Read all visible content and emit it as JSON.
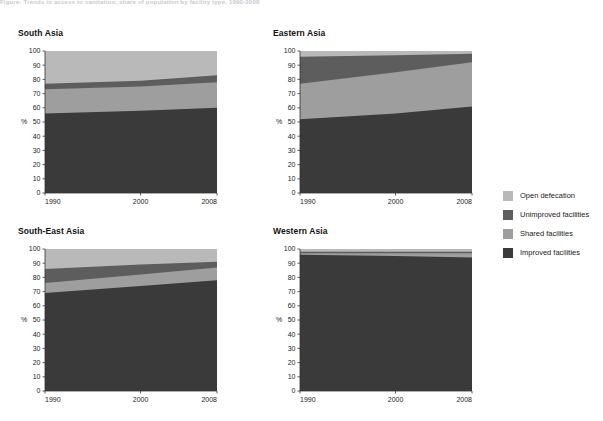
{
  "header": {
    "truncated_caption": "Figure: Trends in access to sanitation, share of population by facility type, 1990-2008"
  },
  "axis": {
    "ylabel": "%",
    "yticks": [
      0,
      10,
      20,
      30,
      40,
      50,
      60,
      70,
      80,
      90,
      100
    ],
    "xticks": [
      "1990",
      "2000",
      "2008"
    ]
  },
  "legend": {
    "items": [
      {
        "label": "Open defecation",
        "color": "#b9b9b9"
      },
      {
        "label": "Unimproved facilities",
        "color": "#5d5d5d"
      },
      {
        "label": "Shared facilities",
        "color": "#9e9e9e"
      },
      {
        "label": "Improved facilities",
        "color": "#3a3a3a"
      }
    ]
  },
  "colors": {
    "improved": "#3a3a3a",
    "shared": "#9e9e9e",
    "unimproved": "#5d5d5d",
    "open_defecation": "#b9b9b9",
    "axis": "#333333"
  },
  "chart_data": [
    {
      "type": "area",
      "title": "South Asia",
      "xlabel": "",
      "ylabel": "%",
      "x": [
        1990,
        2000,
        2008
      ],
      "xlim": [
        1990,
        2008
      ],
      "ylim": [
        0,
        100
      ],
      "grid": false,
      "stacked": true,
      "legend_position": "right",
      "series": [
        {
          "name": "Improved facilities",
          "values": [
            56,
            58,
            60
          ]
        },
        {
          "name": "Shared facilities",
          "values": [
            17,
            17,
            18
          ]
        },
        {
          "name": "Unimproved facilities",
          "values": [
            4,
            4,
            5
          ]
        },
        {
          "name": "Open defecation",
          "values": [
            23,
            21,
            17
          ]
        }
      ],
      "cumulative": [
        {
          "name": "Improved facilities",
          "values": [
            56,
            58,
            60
          ]
        },
        {
          "name": "Shared facilities",
          "values": [
            73,
            75,
            78
          ]
        },
        {
          "name": "Unimproved facilities",
          "values": [
            77,
            79,
            83
          ]
        },
        {
          "name": "Open defecation",
          "values": [
            100,
            100,
            100
          ]
        }
      ]
    },
    {
      "type": "area",
      "title": "Eastern Asia",
      "xlabel": "",
      "ylabel": "%",
      "x": [
        1990,
        2000,
        2008
      ],
      "xlim": [
        1990,
        2008
      ],
      "ylim": [
        0,
        100
      ],
      "grid": false,
      "stacked": true,
      "legend_position": "right",
      "series": [
        {
          "name": "Improved facilities",
          "values": [
            52,
            56,
            61
          ]
        },
        {
          "name": "Shared facilities",
          "values": [
            25,
            29,
            31
          ]
        },
        {
          "name": "Unimproved facilities",
          "values": [
            19,
            12,
            6
          ]
        },
        {
          "name": "Open defecation",
          "values": [
            4,
            3,
            2
          ]
        }
      ],
      "cumulative": [
        {
          "name": "Improved facilities",
          "values": [
            52,
            56,
            61
          ]
        },
        {
          "name": "Shared facilities",
          "values": [
            77,
            85,
            92
          ]
        },
        {
          "name": "Unimproved facilities",
          "values": [
            96,
            97,
            98
          ]
        },
        {
          "name": "Open defecation",
          "values": [
            100,
            100,
            100
          ]
        }
      ]
    },
    {
      "type": "area",
      "title": "South-East Asia",
      "xlabel": "",
      "ylabel": "%",
      "x": [
        1990,
        2000,
        2008
      ],
      "xlim": [
        1990,
        2008
      ],
      "ylim": [
        0,
        100
      ],
      "grid": false,
      "stacked": true,
      "legend_position": "right",
      "series": [
        {
          "name": "Improved facilities",
          "values": [
            69,
            74,
            78
          ]
        },
        {
          "name": "Shared facilities",
          "values": [
            7,
            8,
            9
          ]
        },
        {
          "name": "Unimproved facilities",
          "values": [
            10,
            7,
            4
          ]
        },
        {
          "name": "Open defecation",
          "values": [
            14,
            11,
            9
          ]
        }
      ],
      "cumulative": [
        {
          "name": "Improved facilities",
          "values": [
            69,
            74,
            78
          ]
        },
        {
          "name": "Shared facilities",
          "values": [
            76,
            82,
            87
          ]
        },
        {
          "name": "Unimproved facilities",
          "values": [
            86,
            89,
            91
          ]
        },
        {
          "name": "Open defecation",
          "values": [
            100,
            100,
            100
          ]
        }
      ]
    },
    {
      "type": "area",
      "title": "Western Asia",
      "xlabel": "",
      "ylabel": "%",
      "x": [
        1990,
        2000,
        2008
      ],
      "xlim": [
        1990,
        2008
      ],
      "ylim": [
        0,
        100
      ],
      "grid": false,
      "stacked": true,
      "legend_position": "right",
      "series": [
        {
          "name": "Improved facilities",
          "values": [
            96,
            95,
            94
          ]
        },
        {
          "name": "Shared facilities",
          "values": [
            1,
            2,
            3
          ]
        },
        {
          "name": "Unimproved facilities",
          "values": [
            1,
            1,
            1
          ]
        },
        {
          "name": "Open defecation",
          "values": [
            2,
            2,
            2
          ]
        }
      ],
      "cumulative": [
        {
          "name": "Improved facilities",
          "values": [
            96,
            95,
            94
          ]
        },
        {
          "name": "Shared facilities",
          "values": [
            97,
            97,
            97
          ]
        },
        {
          "name": "Unimproved facilities",
          "values": [
            98,
            98,
            98
          ]
        },
        {
          "name": "Open defecation",
          "values": [
            100,
            100,
            100
          ]
        }
      ]
    }
  ]
}
